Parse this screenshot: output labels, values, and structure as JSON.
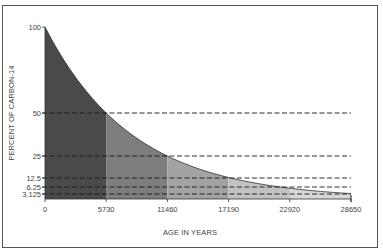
{
  "chart_data": {
    "type": "area",
    "title": "",
    "xlabel": "AGE IN YEARS",
    "ylabel": "PERCENT OF CARBON-14",
    "x_ticks": [
      0,
      5730,
      11460,
      17190,
      22920,
      28650
    ],
    "x_tick_labels": [
      "0",
      "5730",
      "11460",
      "17190",
      "22920",
      "28650"
    ],
    "y_ticks": [
      100,
      50,
      25,
      12.5,
      6.25,
      3.125
    ],
    "y_tick_labels": [
      "100",
      "50",
      "25",
      "12.5",
      "6.25",
      "3.125"
    ],
    "xlim": [
      0,
      28650
    ],
    "ylim": [
      0,
      100
    ],
    "grid": false,
    "series": [
      {
        "name": "Carbon-14 remaining",
        "x": [
          0,
          5730,
          11460,
          17190,
          22920,
          28650
        ],
        "values": [
          100,
          50,
          25,
          12.5,
          6.25,
          3.125
        ]
      }
    ],
    "half_life_years": 5730,
    "reference_lines": [
      {
        "y": 50,
        "style": "dashed"
      },
      {
        "y": 25,
        "style": "dashed"
      },
      {
        "y": 12.5,
        "style": "dashed"
      },
      {
        "y": 6.25,
        "style": "dashed"
      },
      {
        "y": 3.125,
        "style": "dashed"
      }
    ],
    "band_colors": [
      "#4a4a4a",
      "#7d7d7d",
      "#a3a3a3",
      "#c2c2c2",
      "#d8d8d8"
    ]
  }
}
